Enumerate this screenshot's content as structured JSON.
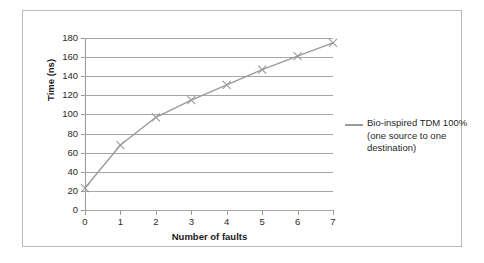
{
  "chart_data": {
    "type": "line",
    "title": "",
    "xlabel": "Number of faults",
    "ylabel": "Time (ns)",
    "x": [
      0,
      1,
      2,
      3,
      4,
      5,
      6,
      7
    ],
    "xticklabels": [
      "0",
      "1",
      "2",
      "3",
      "4",
      "5",
      "6",
      "7"
    ],
    "yticklabels": [
      "0",
      "20",
      "40",
      "60",
      "80",
      "100",
      "120",
      "140",
      "160",
      "180"
    ],
    "yticks": [
      0,
      20,
      40,
      60,
      80,
      100,
      120,
      140,
      160,
      180
    ],
    "xlim": [
      0,
      7
    ],
    "ylim": [
      0,
      180
    ],
    "grid": "horizontal",
    "legend_position": "right",
    "series": [
      {
        "name": "Bio-inspired TDM 100% (one source to one destination)",
        "values": [
          23,
          68,
          97,
          115,
          131,
          147,
          161,
          175
        ],
        "color": "#9a9a9a",
        "marker": "x"
      }
    ]
  },
  "legend": {
    "entries": [
      {
        "line1": "Bio-inspired TDM 100%",
        "line2": "(one source to one",
        "line3": "destination)",
        "color": "#9a9a9a"
      }
    ]
  },
  "style": {
    "frame_border_color": "#b9b9b9",
    "gridline_color": "#a6a6a6",
    "axis_color": "#9a9a9a",
    "text_color": "#1f1f1f",
    "background": "#ffffff"
  }
}
